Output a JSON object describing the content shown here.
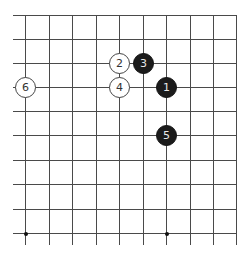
{
  "board": {
    "view": "top-right corner",
    "columns": 10,
    "rows": 10,
    "line_color": "#4a4a4a",
    "x_lines": [
      25,
      49,
      72,
      96,
      119,
      143,
      166,
      190,
      213,
      236
    ],
    "y_lines": [
      15,
      39,
      63,
      87,
      111,
      135,
      160,
      184,
      209,
      233
    ],
    "hoshi": [
      {
        "col": 0,
        "row": 9
      },
      {
        "col": 6,
        "row": 9
      }
    ]
  },
  "stones": [
    {
      "move": "1",
      "color": "black",
      "col": 6,
      "row": 3
    },
    {
      "move": "2",
      "color": "white",
      "col": 4,
      "row": 2
    },
    {
      "move": "3",
      "color": "black",
      "col": 5,
      "row": 2
    },
    {
      "move": "4",
      "color": "white",
      "col": 4,
      "row": 3
    },
    {
      "move": "5",
      "color": "black",
      "col": 6,
      "row": 5
    },
    {
      "move": "6",
      "color": "white",
      "col": 0,
      "row": 3
    }
  ]
}
